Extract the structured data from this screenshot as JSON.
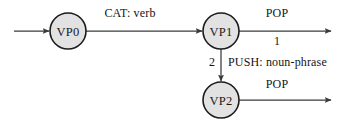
{
  "diagram": {
    "type": "state-transition-network",
    "colors": {
      "node_fill": "#e2e2e2",
      "node_stroke": "#1b1b1b",
      "edge_stroke": "#3a3a3a",
      "text": "#141414",
      "background": "#ffffff"
    },
    "nodes": [
      {
        "id": "VP0",
        "label": "VP0",
        "cx": 68,
        "cy": 31,
        "r": 18
      },
      {
        "id": "VP1",
        "label": "VP1",
        "cx": 221,
        "cy": 31,
        "r": 18
      },
      {
        "id": "VP2",
        "label": "VP2",
        "cx": 221,
        "cy": 100,
        "r": 18
      }
    ],
    "edges": [
      {
        "id": "start-to-vp0",
        "from": "",
        "to": "VP0",
        "label": "",
        "sublabel": "",
        "orientation": "horizontal"
      },
      {
        "id": "vp0-to-vp1",
        "from": "VP0",
        "to": "VP1",
        "label": "CAT: verb",
        "sublabel": "",
        "orientation": "horizontal"
      },
      {
        "id": "vp1-pop",
        "from": "VP1",
        "to": "",
        "label": "POP",
        "sublabel": "1",
        "orientation": "horizontal"
      },
      {
        "id": "vp1-to-vp2",
        "from": "VP1",
        "to": "VP2",
        "label": "PUSH: noun-phrase",
        "sublabel": "2",
        "orientation": "vertical"
      },
      {
        "id": "vp2-pop",
        "from": "VP2",
        "to": "",
        "label": "POP",
        "sublabel": "",
        "orientation": "horizontal"
      }
    ]
  }
}
